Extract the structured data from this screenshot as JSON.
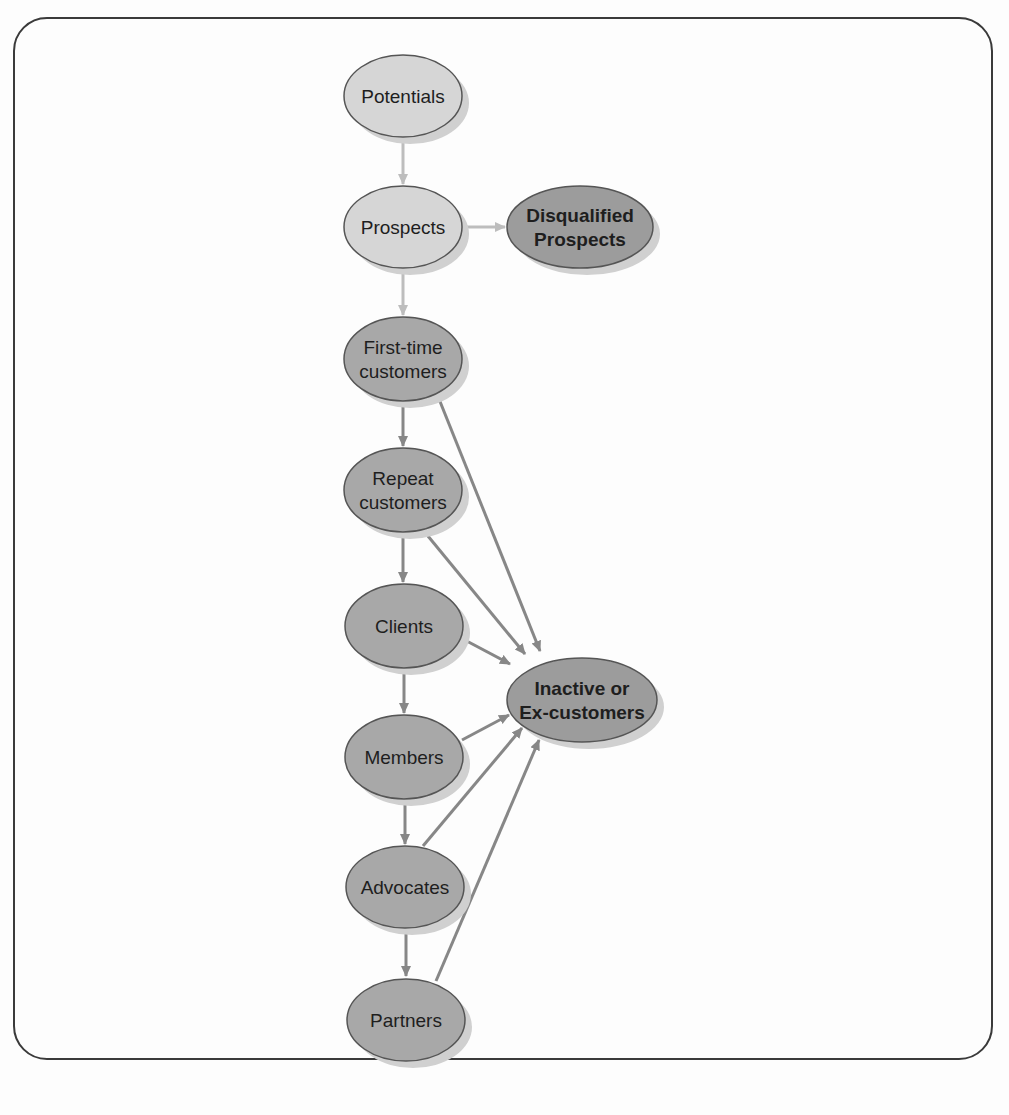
{
  "diagram": {
    "colors": {
      "frame_border": "#3a3a3a",
      "light_fill": "#d6d6d6",
      "mid_fill": "#a8a8a8",
      "dark_fill": "#9c9c9c",
      "node_stroke": "#555555",
      "light_edge": "#bdbdbd",
      "dark_edge": "#878787",
      "shadow": "#d0d0d0"
    },
    "nodes": [
      {
        "id": "potentials",
        "lines": [
          "Potentials"
        ],
        "cx": 403,
        "cy": 96,
        "rx": 59,
        "ry": 41,
        "tone": "light",
        "bold": false
      },
      {
        "id": "prospects",
        "lines": [
          "Prospects"
        ],
        "cx": 403,
        "cy": 227,
        "rx": 59,
        "ry": 41,
        "tone": "light",
        "bold": false
      },
      {
        "id": "disqualified-prospects",
        "lines": [
          "Disqualified",
          "Prospects"
        ],
        "cx": 580,
        "cy": 227,
        "rx": 73,
        "ry": 41,
        "tone": "dark",
        "bold": true
      },
      {
        "id": "first-time-customers",
        "lines": [
          "First-time",
          "customers"
        ],
        "cx": 403,
        "cy": 359,
        "rx": 59,
        "ry": 42,
        "tone": "mid",
        "bold": false
      },
      {
        "id": "repeat-customers",
        "lines": [
          "Repeat",
          "customers"
        ],
        "cx": 403,
        "cy": 490,
        "rx": 59,
        "ry": 42,
        "tone": "mid",
        "bold": false
      },
      {
        "id": "clients",
        "lines": [
          "Clients"
        ],
        "cx": 404,
        "cy": 626,
        "rx": 59,
        "ry": 42,
        "tone": "mid",
        "bold": false
      },
      {
        "id": "inactive-or-ex-customers",
        "lines": [
          "Inactive or",
          "Ex-customers"
        ],
        "cx": 582,
        "cy": 700,
        "rx": 75,
        "ry": 42,
        "tone": "dark",
        "bold": true
      },
      {
        "id": "members",
        "lines": [
          "Members"
        ],
        "cx": 404,
        "cy": 757,
        "rx": 59,
        "ry": 42,
        "tone": "mid",
        "bold": false
      },
      {
        "id": "advocates",
        "lines": [
          "Advocates"
        ],
        "cx": 405,
        "cy": 887,
        "rx": 59,
        "ry": 41,
        "tone": "mid",
        "bold": false
      },
      {
        "id": "partners",
        "lines": [
          "Partners"
        ],
        "cx": 406,
        "cy": 1020,
        "rx": 59,
        "ry": 41,
        "tone": "mid",
        "bold": false
      }
    ],
    "edges": [
      {
        "from": "potentials",
        "to": "prospects",
        "x1": 403,
        "y1": 138,
        "x2": 403,
        "y2": 184,
        "tone": "light"
      },
      {
        "from": "prospects",
        "to": "disqualified-prospects",
        "x1": 463,
        "y1": 227,
        "x2": 505,
        "y2": 227,
        "tone": "light"
      },
      {
        "from": "prospects",
        "to": "first-time-customers",
        "x1": 403,
        "y1": 269,
        "x2": 403,
        "y2": 315,
        "tone": "light"
      },
      {
        "from": "first-time-customers",
        "to": "repeat-customers",
        "x1": 403,
        "y1": 402,
        "x2": 403,
        "y2": 446,
        "tone": "dark"
      },
      {
        "from": "repeat-customers",
        "to": "clients",
        "x1": 403,
        "y1": 533,
        "x2": 403,
        "y2": 582,
        "tone": "dark"
      },
      {
        "from": "clients",
        "to": "members",
        "x1": 404,
        "y1": 669,
        "x2": 404,
        "y2": 713,
        "tone": "dark"
      },
      {
        "from": "members",
        "to": "advocates",
        "x1": 405,
        "y1": 800,
        "x2": 405,
        "y2": 844,
        "tone": "dark"
      },
      {
        "from": "advocates",
        "to": "partners",
        "x1": 406,
        "y1": 929,
        "x2": 406,
        "y2": 976,
        "tone": "dark"
      },
      {
        "from": "first-time-customers",
        "to": "inactive-or-ex-customers",
        "x1": 437,
        "y1": 394,
        "x2": 540,
        "y2": 651,
        "tone": "dark"
      },
      {
        "from": "repeat-customers",
        "to": "inactive-or-ex-customers",
        "x1": 423,
        "y1": 530,
        "x2": 525,
        "y2": 654,
        "tone": "dark"
      },
      {
        "from": "clients",
        "to": "inactive-or-ex-customers",
        "x1": 461,
        "y1": 638,
        "x2": 510,
        "y2": 664,
        "tone": "dark"
      },
      {
        "from": "members",
        "to": "inactive-or-ex-customers",
        "x1": 462,
        "y1": 740,
        "x2": 509,
        "y2": 715,
        "tone": "dark"
      },
      {
        "from": "advocates",
        "to": "inactive-or-ex-customers",
        "x1": 423,
        "y1": 846,
        "x2": 522,
        "y2": 728,
        "tone": "dark"
      },
      {
        "from": "partners",
        "to": "inactive-or-ex-customers",
        "x1": 436,
        "y1": 981,
        "x2": 539,
        "y2": 740,
        "tone": "dark"
      }
    ]
  }
}
